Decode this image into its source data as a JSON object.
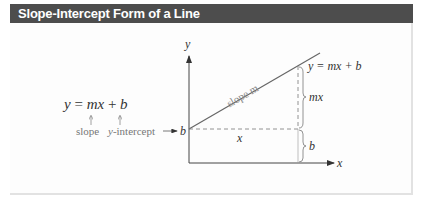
{
  "header": {
    "title": "Slope-Intercept Form of a Line"
  },
  "equation": {
    "text": "y = mx + b",
    "slope_label": "slope",
    "intercept_label_var": "y",
    "intercept_label_rest": "-intercept",
    "intercept_arrow": "→",
    "intercept_symbol": "b"
  },
  "graph": {
    "y_axis_label": "y",
    "x_axis_label": "x",
    "line_label": "slope m",
    "point_label": "y = mx + b",
    "rise_label": "mx",
    "intercept_height_label": "b",
    "run_label": "x"
  },
  "colors": {
    "header_bg": "#4d4d4d",
    "line": "#555555",
    "text": "#333333"
  }
}
